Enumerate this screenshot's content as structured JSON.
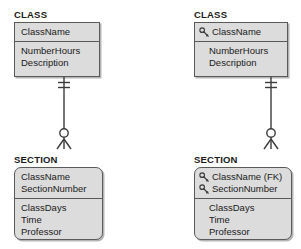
{
  "diagram_title": "ER diagram comparison: CLASS to SECTION identifying relationship",
  "colors": {
    "box_fill": "#dcdcdc",
    "box_border": "#5a5a5a",
    "text": "#1a1a1a",
    "key_icon": "#3c3c3c",
    "connector": "#3c3c3c",
    "page_background": "#ffffff"
  },
  "diagrams": [
    {
      "id": "left",
      "entities": [
        {
          "name": "CLASS",
          "label": "CLASS",
          "shape": "square",
          "key_compartment": {
            "attributes": [
              {
                "label": "ClassName",
                "key": false,
                "indented": false
              }
            ]
          },
          "attribute_compartment": {
            "attributes": [
              {
                "label": "NumberHours",
                "key": false,
                "indented": false
              },
              {
                "label": "Description",
                "key": false,
                "indented": false
              }
            ]
          }
        },
        {
          "name": "SECTION",
          "label": "SECTION",
          "shape": "rounded",
          "key_compartment": {
            "attributes": [
              {
                "label": "ClassName",
                "key": false,
                "indented": false
              },
              {
                "label": "SectionNumber",
                "key": false,
                "indented": false
              }
            ]
          },
          "attribute_compartment": {
            "attributes": [
              {
                "label": "ClassDays",
                "key": false,
                "indented": false
              },
              {
                "label": "Time",
                "key": false,
                "indented": false
              },
              {
                "label": "Professor",
                "key": false,
                "indented": false
              }
            ]
          }
        }
      ],
      "relationship": {
        "parent_cardinality": "one-and-only-one",
        "child_cardinality": "zero-or-many",
        "line_style": "solid"
      }
    },
    {
      "id": "right",
      "entities": [
        {
          "name": "CLASS",
          "label": "CLASS",
          "shape": "square",
          "key_compartment": {
            "attributes": [
              {
                "label": "ClassName",
                "key": true,
                "indented": false
              }
            ]
          },
          "attribute_compartment": {
            "attributes": [
              {
                "label": "NumberHours",
                "key": false,
                "indented": true
              },
              {
                "label": "Description",
                "key": false,
                "indented": true
              }
            ]
          }
        },
        {
          "name": "SECTION",
          "label": "SECTION",
          "shape": "rounded",
          "key_compartment": {
            "attributes": [
              {
                "label": "ClassName (FK)",
                "key": true,
                "indented": false
              },
              {
                "label": "SectionNumber",
                "key": true,
                "indented": false
              }
            ]
          },
          "attribute_compartment": {
            "attributes": [
              {
                "label": "ClassDays",
                "key": false,
                "indented": true
              },
              {
                "label": "Time",
                "key": false,
                "indented": true
              },
              {
                "label": "Professor",
                "key": false,
                "indented": true
              }
            ]
          }
        }
      ],
      "relationship": {
        "parent_cardinality": "one-and-only-one",
        "child_cardinality": "zero-or-many",
        "line_style": "solid"
      }
    }
  ],
  "icons": {
    "key": "key-icon"
  }
}
